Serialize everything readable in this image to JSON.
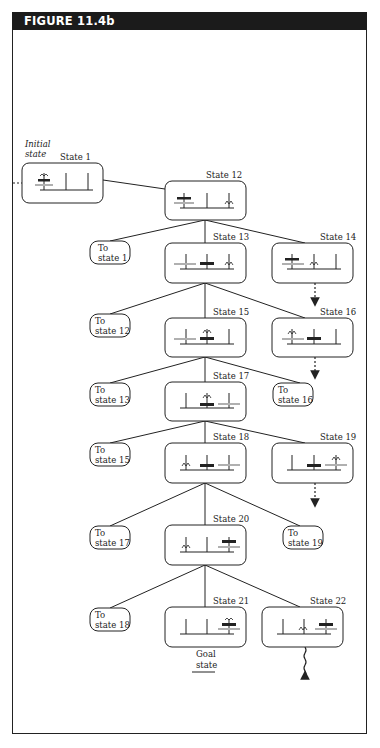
{
  "figure": {
    "title": "FIGURE 11.4b",
    "initial_label_line1": "Initial",
    "initial_label_line2": "state",
    "goal_label_line1": "Goal",
    "goal_label_line2": "state"
  },
  "states": [
    {
      "id": "state-1",
      "label": "State 1",
      "x": 22,
      "y": 163
    },
    {
      "id": "state-12",
      "label": "State 12",
      "x": 165,
      "y": 181
    },
    {
      "id": "state-13",
      "label": "State 13",
      "x": 165,
      "y": 243
    },
    {
      "id": "state-14",
      "label": "State 14",
      "x": 272,
      "y": 243
    },
    {
      "id": "state-15",
      "label": "State 15",
      "x": 165,
      "y": 318
    },
    {
      "id": "state-16",
      "label": "State 16",
      "x": 272,
      "y": 318
    },
    {
      "id": "state-17",
      "label": "State 17",
      "x": 165,
      "y": 382
    },
    {
      "id": "state-18",
      "label": "State 18",
      "x": 165,
      "y": 443
    },
    {
      "id": "state-19",
      "label": "State 19",
      "x": 272,
      "y": 443
    },
    {
      "id": "state-20",
      "label": "State 20",
      "x": 165,
      "y": 525
    },
    {
      "id": "state-21",
      "label": "State 21",
      "x": 165,
      "y": 607
    },
    {
      "id": "state-22",
      "label": "State 22",
      "x": 262,
      "y": 607
    }
  ],
  "back_links": [
    {
      "line1": "To",
      "line2": "state 1",
      "x": 90,
      "y": 241
    },
    {
      "line1": "To",
      "line2": "state 12",
      "x": 90,
      "y": 314
    },
    {
      "line1": "To",
      "line2": "state 13",
      "x": 90,
      "y": 383
    },
    {
      "line1": "To",
      "line2": "state 16",
      "x": 273,
      "y": 383
    },
    {
      "line1": "To",
      "line2": "state 15",
      "x": 90,
      "y": 443
    },
    {
      "line1": "To",
      "line2": "state 17",
      "x": 90,
      "y": 526
    },
    {
      "line1": "To",
      "line2": "state 19",
      "x": 283,
      "y": 526
    },
    {
      "line1": "To",
      "line2": "state 18",
      "x": 90,
      "y": 608
    }
  ],
  "colors": {
    "header_bg": "#1b1b1b",
    "ink": "#222222",
    "disk_gray": "#b0b0b0"
  }
}
